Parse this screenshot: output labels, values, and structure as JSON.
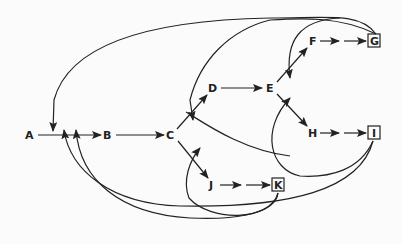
{
  "diagram": {
    "type": "directed-graph",
    "nodes": [
      {
        "id": "A",
        "label": "A",
        "boxed": false
      },
      {
        "id": "B",
        "label": "B",
        "boxed": false
      },
      {
        "id": "C",
        "label": "C",
        "boxed": false
      },
      {
        "id": "D",
        "label": "D",
        "boxed": false
      },
      {
        "id": "E",
        "label": "E",
        "boxed": false
      },
      {
        "id": "F",
        "label": "F",
        "boxed": false
      },
      {
        "id": "G",
        "label": "G",
        "boxed": true
      },
      {
        "id": "H",
        "label": "H",
        "boxed": false
      },
      {
        "id": "I",
        "label": "I",
        "boxed": true
      },
      {
        "id": "J",
        "label": "J",
        "boxed": false
      },
      {
        "id": "K",
        "label": "K",
        "boxed": true
      }
    ],
    "edges": [
      {
        "from": "A",
        "to": "B",
        "style": "solid"
      },
      {
        "from": "B",
        "to": "C",
        "style": "solid"
      },
      {
        "from": "C",
        "to": "D",
        "style": "solid"
      },
      {
        "from": "C",
        "to": "J",
        "style": "solid"
      },
      {
        "from": "D",
        "to": "E",
        "style": "solid"
      },
      {
        "from": "E",
        "to": "F",
        "style": "solid"
      },
      {
        "from": "E",
        "to": "H",
        "style": "solid"
      },
      {
        "from": "F",
        "to": "G",
        "style": "dashed-double-arrow"
      },
      {
        "from": "H",
        "to": "I",
        "style": "dashed-double-arrow"
      },
      {
        "from": "J",
        "to": "K",
        "style": "dashed-double-arrow"
      },
      {
        "from": "G",
        "to": "A-B",
        "style": "feedback-curve"
      },
      {
        "from": "G",
        "to": "C-D",
        "style": "feedback-curve"
      },
      {
        "from": "G",
        "to": "E-F",
        "style": "feedback-curve"
      },
      {
        "from": "I",
        "to": "A-B",
        "style": "feedback-curve"
      },
      {
        "from": "I",
        "to": "E-H",
        "style": "feedback-curve"
      },
      {
        "from": "K",
        "to": "A-B",
        "style": "feedback-curve"
      },
      {
        "from": "K",
        "to": "C-J",
        "style": "feedback-curve"
      }
    ]
  }
}
